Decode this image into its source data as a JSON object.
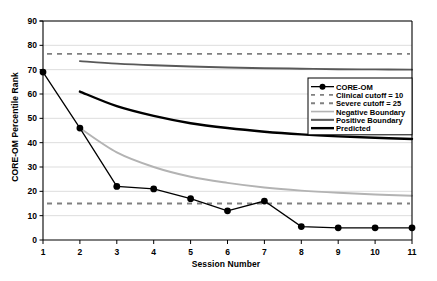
{
  "chart_data": {
    "type": "line",
    "title": "",
    "xlabel": "Session Number",
    "ylabel": "CORE-OM Percentile Rank",
    "xlim": [
      1,
      11
    ],
    "ylim": [
      0,
      90
    ],
    "ytick_step": 10,
    "grid": true,
    "legend_position": "right-middle",
    "x": [
      1,
      2,
      3,
      4,
      5,
      6,
      7,
      8,
      9,
      10,
      11
    ],
    "xticks": [
      "1",
      "2",
      "3",
      "4",
      "5",
      "6",
      "7",
      "8",
      "9",
      "10",
      "11"
    ],
    "yticks": [
      "0",
      "10",
      "20",
      "30",
      "40",
      "50",
      "60",
      "70",
      "80",
      "90"
    ],
    "series": [
      {
        "name": "CORE-OM",
        "kind": "line-markers",
        "color": "#000000",
        "x": [
          1,
          2,
          3,
          4,
          5,
          6,
          7,
          8,
          9,
          10,
          11
        ],
        "values": [
          69,
          46,
          22,
          21,
          17,
          12,
          16,
          5.5,
          5,
          5,
          5
        ]
      },
      {
        "name": "Positive Boundary",
        "kind": "curve",
        "color": "#595959",
        "x": [
          2,
          3,
          4,
          5,
          6,
          7,
          8,
          9,
          10,
          11
        ],
        "values": [
          73.5,
          72.5,
          71.8,
          71.3,
          70.9,
          70.6,
          70.4,
          70.2,
          70.1,
          70.0
        ]
      },
      {
        "name": "Predicted",
        "kind": "curve",
        "color": "#000000",
        "x": [
          2,
          3,
          4,
          5,
          6,
          7,
          8,
          9,
          10,
          11
        ],
        "values": [
          61,
          55,
          51,
          48,
          46,
          44.5,
          43.4,
          42.6,
          42.0,
          41.5
        ]
      },
      {
        "name": "Negative Boundary",
        "kind": "curve",
        "color": "#b3b3b3",
        "x": [
          2,
          3,
          4,
          5,
          6,
          7,
          8,
          9,
          10,
          11
        ],
        "values": [
          46,
          36,
          30,
          26,
          23.5,
          21.6,
          20.3,
          19.4,
          18.7,
          18.2
        ]
      }
    ],
    "reference_lines": [
      {
        "name": "Severe cutoff = 25",
        "value": 76.5,
        "style": "dashed",
        "color": "#808080"
      },
      {
        "name": "Clinical cutoff = 10",
        "value": 15.0,
        "style": "dashed",
        "color": "#808080"
      }
    ],
    "legend": [
      {
        "label": "CORE-OM",
        "swatch": "marker-line",
        "color": "#000000"
      },
      {
        "label": "Clinical cutoff = 10",
        "swatch": "dashed",
        "color": "#808080"
      },
      {
        "label": "Severe cutoff = 25",
        "swatch": "dashed",
        "color": "#808080"
      },
      {
        "label": "Negative Boundary",
        "swatch": "solid-thin",
        "color": "#b3b3b3"
      },
      {
        "label": "Positive Boundary",
        "swatch": "solid-med",
        "color": "#595959"
      },
      {
        "label": "Predicted",
        "swatch": "solid-thick",
        "color": "#000000"
      }
    ]
  }
}
